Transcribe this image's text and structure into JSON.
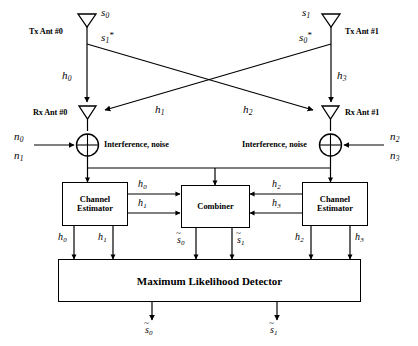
{
  "diagram": {
    "transmit": {
      "ant0": {
        "caption": "Tx Ant #0",
        "symbol_top": "s",
        "symbol_top_sub": "0",
        "symbol_bottom": "s",
        "symbol_bottom_sub": "1",
        "symbol_bottom_sup": "*"
      },
      "ant1": {
        "caption": "Tx Ant #1",
        "symbol_top": "s",
        "symbol_top_sub": "1",
        "symbol_bottom": "s",
        "symbol_bottom_sub": "0",
        "symbol_bottom_sup": "*"
      }
    },
    "channels": [
      {
        "name": "h",
        "sub": "0"
      },
      {
        "name": "h",
        "sub": "1"
      },
      {
        "name": "h",
        "sub": "2"
      },
      {
        "name": "h",
        "sub": "3"
      }
    ],
    "receive": {
      "ant0": {
        "caption": "Rx Ant #0"
      },
      "ant1": {
        "caption": "Rx Ant #1"
      }
    },
    "noise": {
      "left_caption": "Interference, noise",
      "right_caption": "Interference, noise",
      "left_terms": [
        {
          "name": "n",
          "sub": "0"
        },
        {
          "name": "n",
          "sub": "1"
        }
      ],
      "right_terms": [
        {
          "name": "n",
          "sub": "2"
        },
        {
          "name": "n",
          "sub": "3"
        }
      ]
    },
    "blocks": {
      "channel_estimator_left": {
        "line1": "Channel",
        "line2": "Estimator"
      },
      "channel_estimator_right": {
        "line1": "Channel",
        "line2": "Estimator"
      },
      "combiner": {
        "label": "Combiner"
      },
      "detector": {
        "label": "Maximum Likelihood Detector"
      }
    },
    "estimator_left_outputs_to_combiner": [
      {
        "name": "h",
        "sub": "0"
      },
      {
        "name": "h",
        "sub": "1"
      }
    ],
    "estimator_right_outputs_to_combiner": [
      {
        "name": "h",
        "sub": "2"
      },
      {
        "name": "h",
        "sub": "3"
      }
    ],
    "estimator_left_outputs_to_detector": [
      {
        "name": "h",
        "sub": "0"
      },
      {
        "name": "h",
        "sub": "1"
      }
    ],
    "estimator_right_outputs_to_detector": [
      {
        "name": "h",
        "sub": "2"
      },
      {
        "name": "h",
        "sub": "3"
      }
    ],
    "combiner_outputs": [
      {
        "name": "s",
        "sub": "0",
        "accent": "~"
      },
      {
        "name": "s",
        "sub": "1",
        "accent": "~"
      }
    ],
    "detector_outputs": [
      {
        "name": "s",
        "sub": "0",
        "accent": "~"
      },
      {
        "name": "s",
        "sub": "1",
        "accent": "~"
      }
    ],
    "style": {
      "line_color": "#000000",
      "text_color": "#000000",
      "background": "#ffffff"
    }
  }
}
